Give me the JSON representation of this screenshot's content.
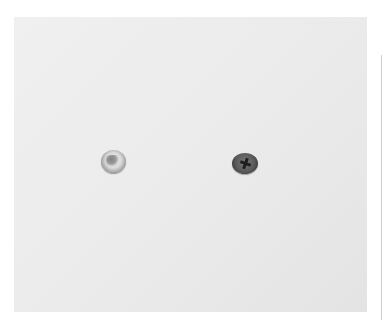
{
  "image": {
    "description": "Two screws photographed on a white surface",
    "background_color": "#ebebeb",
    "objects": [
      {
        "name": "silver-screw-head",
        "color": "#d8d8d8"
      },
      {
        "name": "dark-phillips-screw-head",
        "color": "#5a5a5a"
      }
    ]
  }
}
